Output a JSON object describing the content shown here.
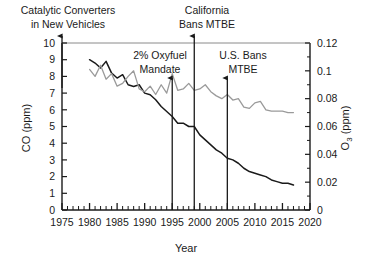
{
  "chart_data": {
    "type": "line",
    "title": "",
    "xlabel": "Year",
    "xlim": [
      1975,
      2020
    ],
    "xticks": [
      1975,
      1980,
      1985,
      1990,
      1995,
      2000,
      2005,
      2010,
      2015,
      2020
    ],
    "xtick_labels": [
      "1975",
      "1980",
      "1985",
      "1990",
      "1995",
      "2000",
      "2005",
      "2010",
      "2015",
      "2020"
    ],
    "grid": false,
    "legend_position": "none",
    "axes": [
      {
        "id": "left",
        "ylabel": "CO (ppm)",
        "ylim": [
          0,
          10
        ],
        "yticks": [
          0,
          1,
          2,
          3,
          4,
          5,
          6,
          7,
          8,
          9,
          10
        ],
        "ytick_labels": [
          "0",
          "1",
          "2",
          "3",
          "4",
          "5",
          "6",
          "7",
          "8",
          "9",
          "10"
        ]
      },
      {
        "id": "right",
        "ylabel": "O3 (ppm)",
        "ylabel_base": "O",
        "ylabel_sub": "3",
        "ylabel_units": " (ppm)",
        "ylim": [
          0,
          0.12
        ],
        "yticks": [
          0,
          0.02,
          0.04,
          0.06,
          0.08,
          0.1,
          0.12
        ],
        "ytick_labels": [
          "0",
          "0.02",
          "0.04",
          "0.06",
          "0.08",
          "0.1",
          "0.12"
        ]
      }
    ],
    "series": [
      {
        "name": "CO (ppm)",
        "axis": "left",
        "color": "#1a1a1a",
        "x": [
          1980,
          1981,
          1982,
          1983,
          1984,
          1985,
          1986,
          1987,
          1988,
          1989,
          1990,
          1991,
          1992,
          1993,
          1994,
          1995,
          1996,
          1997,
          1998,
          1999,
          2000,
          2001,
          2002,
          2003,
          2004,
          2005,
          2006,
          2007,
          2008,
          2009,
          2010,
          2011,
          2012,
          2013,
          2014,
          2015,
          2016,
          2017
        ],
        "values": [
          9.0,
          8.8,
          8.5,
          8.9,
          8.2,
          7.9,
          8.1,
          7.5,
          7.4,
          7.5,
          7.0,
          6.9,
          6.6,
          6.2,
          5.9,
          5.6,
          5.2,
          5.2,
          5.0,
          5.0,
          4.5,
          4.2,
          3.9,
          3.6,
          3.4,
          3.1,
          3.0,
          2.8,
          2.5,
          2.3,
          2.2,
          2.1,
          2.0,
          1.8,
          1.7,
          1.6,
          1.6,
          1.5
        ]
      },
      {
        "name": "O3 (ppm)",
        "axis": "right",
        "color": "#9a9a9a",
        "x": [
          1980,
          1981,
          1982,
          1983,
          1984,
          1985,
          1986,
          1987,
          1988,
          1989,
          1990,
          1991,
          1992,
          1993,
          1994,
          1995,
          1996,
          1997,
          1998,
          1999,
          2000,
          2001,
          2002,
          2003,
          2004,
          2005,
          2006,
          2007,
          2008,
          2009,
          2010,
          2011,
          2012,
          2013,
          2014,
          2015,
          2016,
          2017
        ],
        "values": [
          0.101,
          0.096,
          0.104,
          0.094,
          0.098,
          0.089,
          0.091,
          0.096,
          0.1,
          0.087,
          0.085,
          0.089,
          0.083,
          0.09,
          0.084,
          0.098,
          0.086,
          0.087,
          0.091,
          0.086,
          0.087,
          0.09,
          0.085,
          0.082,
          0.08,
          0.083,
          0.079,
          0.08,
          0.074,
          0.073,
          0.077,
          0.078,
          0.072,
          0.071,
          0.071,
          0.071,
          0.07,
          0.07
        ]
      }
    ],
    "annotations": [
      {
        "id": "catalytic-converters",
        "label_line1": "Catalytic Converters",
        "label_line2": "in New Vehicles",
        "year": 1975,
        "arrow": "up"
      },
      {
        "id": "oxyfuel-mandate",
        "label_line1": "2% Oxyfuel",
        "label_line2": "Mandate",
        "year": 1995,
        "arrow": "up"
      },
      {
        "id": "california-bans-mtbe",
        "label_line1": "California",
        "label_line2": "Bans MTBE",
        "year": 1999,
        "arrow": "up"
      },
      {
        "id": "us-bans-mtbe",
        "label_line1": "U.S. Bans",
        "label_line2": "MTBE",
        "year": 2005,
        "arrow": "up"
      }
    ]
  }
}
